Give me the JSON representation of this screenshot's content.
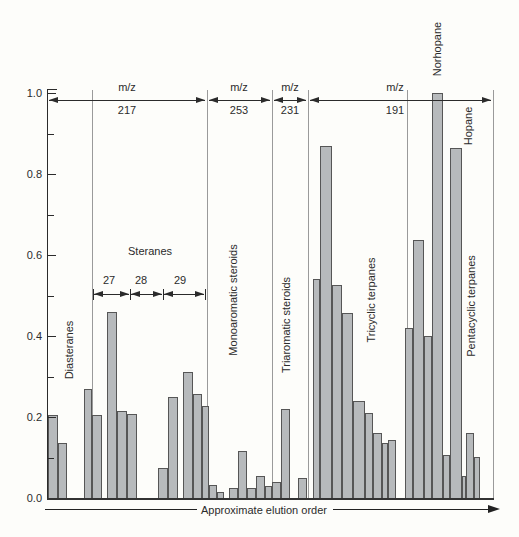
{
  "colors": {
    "bar_fill": "#b7babc",
    "bar_border": "#565656",
    "axis": "#2b2b2b",
    "divider": "#9a9a9a",
    "background": "#fdfdfa"
  },
  "chart_data": {
    "type": "bar",
    "title": "",
    "xlabel": "Approximate elution order",
    "ylabel": "",
    "ylim": [
      0.0,
      1.0
    ],
    "grid": false,
    "yticks": [
      {
        "label": "1.0",
        "v": 1.0
      },
      {
        "label": "0.8",
        "v": 0.8
      },
      {
        "label": "0.6",
        "v": 0.6
      },
      {
        "label": "0.4",
        "v": 0.4
      },
      {
        "label": "0.2",
        "v": 0.2
      },
      {
        "label": "0.0",
        "v": 0.0
      }
    ],
    "minor_yticks": [
      0.9,
      0.7,
      0.5,
      0.3,
      0.1
    ],
    "dividers_x": [
      92,
      207,
      272,
      308,
      407,
      493
    ],
    "mz_regions": [
      {
        "name": "mz-217",
        "label": "m/z",
        "number": "217",
        "x0": 47,
        "x1": 207,
        "label_x": 127
      },
      {
        "name": "mz-253",
        "label": "m/z",
        "number": "253",
        "x0": 207,
        "x1": 272,
        "label_x": 239
      },
      {
        "name": "mz-231",
        "label": "m/z",
        "number": "231",
        "x0": 272,
        "x1": 308,
        "label_x": 290
      },
      {
        "name": "mz-191",
        "label": "m/z",
        "number": "191",
        "x0": 308,
        "x1": 493,
        "label_x": 395
      }
    ],
    "sterane_scale": {
      "segments": [
        {
          "label": "27",
          "x0": 93,
          "x1": 130,
          "label_x": 109
        },
        {
          "label": "28",
          "x0": 130,
          "x1": 163,
          "label_x": 141
        },
        {
          "label": "29",
          "x0": 163,
          "x1": 205,
          "label_x": 180
        }
      ],
      "y": 294,
      "label_y": 280
    },
    "group_labels": [
      {
        "text": "Diasteranes",
        "x": 69,
        "y": 350,
        "rotate": true
      },
      {
        "text": "Steranes",
        "x": 150,
        "y": 251,
        "rotate": false
      },
      {
        "text": "Monoaromatic steroids",
        "x": 233,
        "y": 300,
        "rotate": true
      },
      {
        "text": "Triaromatic steroids",
        "x": 286,
        "y": 325,
        "rotate": true
      },
      {
        "text": "Tricyclic terpanes",
        "x": 371,
        "y": 300,
        "rotate": true
      },
      {
        "text": "Pentacyclic terpanes",
        "x": 471,
        "y": 306,
        "rotate": true
      },
      {
        "text": "Norhopane",
        "x": 437,
        "y": 49,
        "rotate": true
      },
      {
        "text": "Hopane",
        "x": 468,
        "y": 126,
        "rotate": true
      }
    ],
    "bar_groups": [
      {
        "name": "Diasteranes",
        "bars": [
          [
            48,
            10,
            0.205
          ],
          [
            58,
            9,
            0.135
          ]
        ]
      },
      {
        "name": "Steranes",
        "bars": [
          [
            84,
            8,
            0.27
          ],
          [
            92,
            10,
            0.205
          ],
          [
            107,
            10,
            0.46
          ],
          [
            117,
            10,
            0.215
          ],
          [
            127,
            10,
            0.208
          ],
          [
            158,
            10,
            0.074
          ],
          [
            168,
            10,
            0.25
          ],
          [
            183,
            10,
            0.31
          ],
          [
            193,
            9,
            0.258
          ],
          [
            202,
            7,
            0.227
          ]
        ]
      },
      {
        "name": "Monoaromatic steroids",
        "bars": [
          [
            209,
            8,
            0.032
          ],
          [
            217,
            7,
            0.015
          ],
          [
            229,
            9,
            0.025
          ],
          [
            238,
            9,
            0.115
          ],
          [
            247,
            9,
            0.025
          ],
          [
            256,
            9,
            0.054
          ],
          [
            265,
            7,
            0.03
          ]
        ]
      },
      {
        "name": "Triaromatic steroids",
        "bars": [
          [
            272,
            9,
            0.04
          ],
          [
            281,
            9,
            0.22
          ],
          [
            298,
            9,
            0.05
          ]
        ]
      },
      {
        "name": "Tricyclic terpanes",
        "bars": [
          [
            313,
            7,
            0.54
          ],
          [
            320,
            12,
            0.87
          ],
          [
            332,
            10,
            0.525
          ],
          [
            342,
            11,
            0.458
          ],
          [
            353,
            12,
            0.24
          ],
          [
            365,
            8,
            0.21
          ],
          [
            373,
            9,
            0.16
          ],
          [
            382,
            6,
            0.135
          ],
          [
            388,
            8,
            0.143
          ]
        ]
      },
      {
        "name": "Pentacyclic terpanes",
        "bars": [
          [
            405,
            8,
            0.42
          ],
          [
            413,
            11,
            0.638
          ],
          [
            424,
            8,
            0.4
          ],
          [
            432,
            11,
            1.0
          ],
          [
            443,
            7,
            0.105
          ],
          [
            450,
            12,
            0.865
          ],
          [
            462,
            4,
            0.055
          ],
          [
            466,
            8,
            0.16
          ],
          [
            474,
            6,
            0.1
          ]
        ]
      }
    ],
    "bottom_arrow": {
      "text": "Approximate elution order",
      "y": 509,
      "text_x": 264,
      "left_segment": [
        45,
        197
      ],
      "right_segment": [
        333,
        490
      ]
    }
  }
}
